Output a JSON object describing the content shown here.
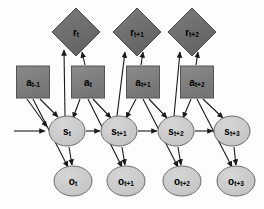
{
  "figure": {
    "background_color": "#fdfdfd",
    "edge_color": "#1a1a1a"
  },
  "legend": {
    "reward_shape": "diamond",
    "action_shape": "square",
    "state_shape": "ellipse",
    "observation_shape": "ellipse"
  },
  "styles": {
    "reward_fill": "#6e6e6e",
    "reward_stroke": "#4a4a4a",
    "action_fill": "#808080",
    "action_stroke": "#545454",
    "state_fill": "#c9c9c9",
    "state_stroke": "#6a6a6a",
    "observation_fill": "#cccccc",
    "observation_stroke": "#6a6a6a"
  },
  "nodes": {
    "rewards": [
      {
        "id": "r_t",
        "base": "r",
        "sub": "t",
        "cx": 76,
        "cy": 32,
        "r": 24
      },
      {
        "id": "r_t1",
        "base": "r",
        "sub": "t+1",
        "cx": 137,
        "cy": 32,
        "r": 24
      },
      {
        "id": "r_t2",
        "base": "r",
        "sub": "t+2",
        "cx": 192,
        "cy": 32,
        "r": 24
      }
    ],
    "actions": [
      {
        "id": "a_tm1",
        "base": "a",
        "sub": "t-1",
        "cx": 33,
        "cy": 82,
        "w": 33,
        "h": 32
      },
      {
        "id": "a_t",
        "base": "a",
        "sub": "t",
        "cx": 88,
        "cy": 82,
        "w": 33,
        "h": 32
      },
      {
        "id": "a_t1",
        "base": "a",
        "sub": "t+1",
        "cx": 143,
        "cy": 82,
        "w": 33,
        "h": 32
      },
      {
        "id": "a_t2",
        "base": "a",
        "sub": "t+2",
        "cx": 197,
        "cy": 82,
        "w": 33,
        "h": 32
      }
    ],
    "states": [
      {
        "id": "s_t",
        "base": "s",
        "sub": "t",
        "cx": 67,
        "cy": 131,
        "rx": 18,
        "ry": 15
      },
      {
        "id": "s_t1",
        "base": "s",
        "sub": "t+1",
        "cx": 119,
        "cy": 131,
        "rx": 18,
        "ry": 15
      },
      {
        "id": "s_t2",
        "base": "s",
        "sub": "t+2",
        "cx": 176,
        "cy": 131,
        "rx": 18,
        "ry": 15
      },
      {
        "id": "s_t3",
        "base": "s",
        "sub": "t+3",
        "cx": 232,
        "cy": 131,
        "rx": 18,
        "ry": 15
      }
    ],
    "observations": [
      {
        "id": "o_t",
        "base": "o",
        "sub": "t",
        "cx": 73,
        "cy": 181,
        "rx": 19,
        "ry": 15
      },
      {
        "id": "o_t1",
        "base": "o",
        "sub": "t+1",
        "cx": 126,
        "cy": 181,
        "rx": 19,
        "ry": 15
      },
      {
        "id": "o_t2",
        "base": "o",
        "sub": "t+2",
        "cx": 182,
        "cy": 181,
        "rx": 19,
        "ry": 15
      },
      {
        "id": "o_t3",
        "base": "o",
        "sub": "t+3",
        "cx": 236,
        "cy": 181,
        "rx": 19,
        "ry": 15
      }
    ]
  },
  "edges": [
    {
      "from": "prior",
      "to": "s_t",
      "d": "M 14,131 L 45,131"
    },
    {
      "from": "a_tm1",
      "to": "s_t",
      "d": "M 40,99 L 58,117"
    },
    {
      "from": "a_tm1",
      "to": "s_t",
      "d": "M 27,99 L 47,127"
    },
    {
      "from": "a_tm1",
      "to": "o_t",
      "d": "M 33,99 L 68,167"
    },
    {
      "from": "s_t",
      "to": "o_t",
      "d": "M 69,147 L 72,165"
    },
    {
      "from": "s_t",
      "to": "s_t1",
      "d": "M 86,131 L 100,131"
    },
    {
      "from": "s_t",
      "to": "r_t",
      "d": "M 65,116 L 64,50"
    },
    {
      "from": "a_t",
      "to": "r_t",
      "d": "M 85,65 L 82,52"
    },
    {
      "from": "a_t",
      "to": "s_t",
      "d": "M 80,99 L 73,118"
    },
    {
      "from": "a_t",
      "to": "s_t1",
      "d": "M 93,99 L 111,118"
    },
    {
      "from": "a_t",
      "to": "o_t1",
      "d": "M 88,99 L 122,167"
    },
    {
      "from": "s_t1",
      "to": "o_t1",
      "d": "M 122,147 L 125,165"
    },
    {
      "from": "s_t1",
      "to": "s_t2",
      "d": "M 138,131 L 157,131"
    },
    {
      "from": "s_t1",
      "to": "r_t1",
      "d": "M 117,116 L 125,52"
    },
    {
      "from": "a_t1",
      "to": "r_t1",
      "d": "M 141,65 L 143,52"
    },
    {
      "from": "a_t1",
      "to": "s_t1",
      "d": "M 136,99 L 126,118"
    },
    {
      "from": "a_t1",
      "to": "s_t2",
      "d": "M 149,99 L 167,118"
    },
    {
      "from": "a_t1",
      "to": "o_t2",
      "d": "M 143,99 L 178,167"
    },
    {
      "from": "s_t2",
      "to": "o_t2",
      "d": "M 178,147 L 181,165"
    },
    {
      "from": "s_t2",
      "to": "s_t3",
      "d": "M 195,131 L 213,131"
    },
    {
      "from": "s_t2",
      "to": "r_t2",
      "d": "M 174,116 L 180,52"
    },
    {
      "from": "a_t2",
      "to": "r_t2",
      "d": "M 196,65 L 198,52"
    },
    {
      "from": "a_t2",
      "to": "s_t2",
      "d": "M 191,99 L 183,118"
    },
    {
      "from": "a_t2",
      "to": "s_t3",
      "d": "M 203,99 L 223,118"
    },
    {
      "from": "a_t2",
      "to": "o_t3",
      "d": "M 197,99 L 232,167"
    },
    {
      "from": "s_t3",
      "to": "o_t3",
      "d": "M 234,147 L 236,165"
    }
  ]
}
